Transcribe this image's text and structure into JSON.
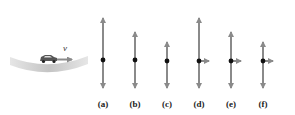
{
  "figure": {
    "velocity_label": "v⃗",
    "colors": {
      "arrow": "#8a8a8a",
      "dot": "#111111",
      "road": "#c8c8c8",
      "label": "#222222"
    },
    "options": [
      {
        "label": "(a)",
        "x": 103,
        "top": 13,
        "bottom": 93,
        "dot_y": 60,
        "horizontal": false
      },
      {
        "label": "(b)",
        "x": 135,
        "top": 27,
        "bottom": 93,
        "dot_y": 60,
        "horizontal": false
      },
      {
        "label": "(c)",
        "x": 167,
        "top": 37,
        "bottom": 93,
        "dot_y": 61,
        "horizontal": false
      },
      {
        "label": "(d)",
        "x": 199,
        "top": 13,
        "bottom": 93,
        "dot_y": 61,
        "horizontal": true,
        "h_end": 214
      },
      {
        "label": "(e)",
        "x": 231,
        "top": 27,
        "bottom": 93,
        "dot_y": 61,
        "horizontal": true,
        "h_end": 246
      },
      {
        "label": "(f)",
        "x": 263,
        "top": 37,
        "bottom": 93,
        "dot_y": 61,
        "horizontal": true,
        "h_end": 278
      }
    ]
  }
}
